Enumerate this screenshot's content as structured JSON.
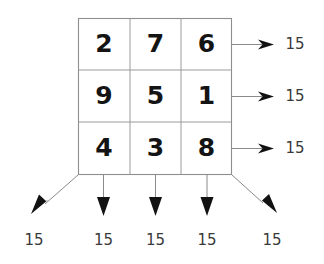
{
  "diagram": {
    "type": "magic-square",
    "magic_constant": "15",
    "grid": {
      "rows": 3,
      "cols": 3,
      "values": [
        [
          "2",
          "7",
          "6"
        ],
        [
          "9",
          "5",
          "1"
        ],
        [
          "4",
          "3",
          "8"
        ]
      ]
    },
    "row_sums": [
      "15",
      "15",
      "15"
    ],
    "column_sums": [
      "15",
      "15",
      "15"
    ],
    "diagonal_sums": {
      "anti_diagonal": "15",
      "main_diagonal": "15"
    },
    "bottom_labels": [
      "15",
      "15",
      "15",
      "15",
      "15"
    ],
    "right_labels": [
      "15",
      "15",
      "15"
    ],
    "colors": {
      "number": "#141414",
      "label": "#3a3a3a",
      "grid_line": "#9a9a9a",
      "arrow_line": "#8a8a8a",
      "arrow_head": "#121212",
      "background": "#ffffff"
    }
  }
}
